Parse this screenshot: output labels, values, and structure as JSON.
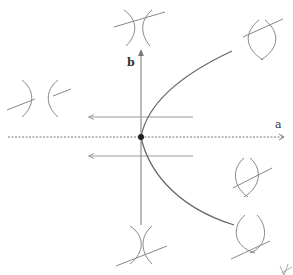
{
  "diagram": {
    "type": "bifurcation-diagram",
    "axes": {
      "horizontal_label": "a",
      "vertical_label": "b"
    },
    "colors": {
      "axis": "#555555",
      "curve": "#666666",
      "glyph": "#888888",
      "origin_point": "#222222",
      "background": "#ffffff"
    },
    "elements": {
      "origin_point": "filled dot at intersection of axes",
      "bifurcation_curve": "parabola opening to the right through the origin (upper and lower branches)",
      "flow_arrows": [
        "left-pointing arrow above a-axis",
        "left-pointing arrow below a-axis"
      ],
      "glyphs": [
        {
          "position": "top-center",
          "shape": "two arcs touching with transversal line"
        },
        {
          "position": "top-right",
          "shape": "lens of two crossing arcs with transversal line"
        },
        {
          "position": "left",
          "shape": "two separated arcs with transversal line"
        },
        {
          "position": "bottom-center",
          "shape": "two arcs touching with transversal line"
        },
        {
          "position": "right-middle",
          "shape": "lens of two crossing arcs with transversal line"
        },
        {
          "position": "bottom-right",
          "shape": "lens of two crossing arcs with transversal line"
        },
        {
          "position": "bottom-right-corner",
          "shape": "partial glyph"
        }
      ]
    }
  }
}
